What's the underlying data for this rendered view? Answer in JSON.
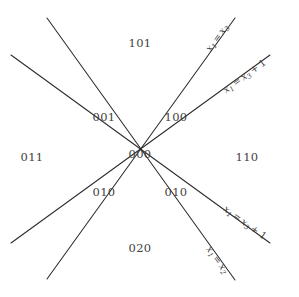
{
  "figure": {
    "background_color": "#ffffff",
    "line_color": "#2b2b2b",
    "text_color": "#3f3f3f",
    "width": 299,
    "height": 297
  },
  "regions": [
    {
      "label": "101",
      "x": 140,
      "y": 43
    },
    {
      "label": "001",
      "x": 104,
      "y": 117
    },
    {
      "label": "100",
      "x": 176,
      "y": 117
    },
    {
      "label": "011",
      "x": 32,
      "y": 157
    },
    {
      "label": "000",
      "x": 140,
      "y": 154
    },
    {
      "label": "110",
      "x": 247,
      "y": 157
    },
    {
      "label": "010",
      "x": 104,
      "y": 192
    },
    {
      "label": "010",
      "x": 176,
      "y": 192
    },
    {
      "label": "020",
      "x": 140,
      "y": 248
    }
  ],
  "lines": [
    {
      "name": "x1-eq-x3",
      "equation_text": "x1 = x3",
      "lhs": "x",
      "lhs_sub": "1",
      "relation": "=",
      "rhs": "x",
      "rhs_sub": "3",
      "offset": "",
      "x1": 47,
      "y1": 279,
      "x2": 235,
      "y2": 18,
      "label_x": 216,
      "label_y": 37,
      "label_rotation": -54
    },
    {
      "name": "x1-eq-x3-plus-1",
      "equation_text": "x1 = x3 + 1",
      "lhs": "x",
      "lhs_sub": "1",
      "relation": "=",
      "rhs": "x",
      "rhs_sub": "3",
      "offset": "+ 1",
      "x1": 11,
      "y1": 243,
      "x2": 270,
      "y2": 55,
      "label_x": 244,
      "label_y": 75,
      "label_rotation": -36
    },
    {
      "name": "x1-eq-x3-plus-1-descending",
      "equation_text": "x1 = x3 + 1",
      "lhs": "x",
      "lhs_sub": "1",
      "relation": "=",
      "rhs": "x",
      "rhs_sub": "3",
      "offset": "+ 1",
      "x1": 11,
      "y1": 55,
      "x2": 270,
      "y2": 243,
      "label_x": 245,
      "label_y": 222,
      "label_rotation": 36
    },
    {
      "name": "x1-eq-x2",
      "equation_text": "x1 = x2",
      "lhs": "x",
      "lhs_sub": "1",
      "relation": "=",
      "rhs": "x",
      "rhs_sub": "2",
      "offset": "",
      "x1": 47,
      "y1": 18,
      "x2": 235,
      "y2": 280,
      "label_x": 217,
      "label_y": 259,
      "label_rotation": 54
    }
  ]
}
